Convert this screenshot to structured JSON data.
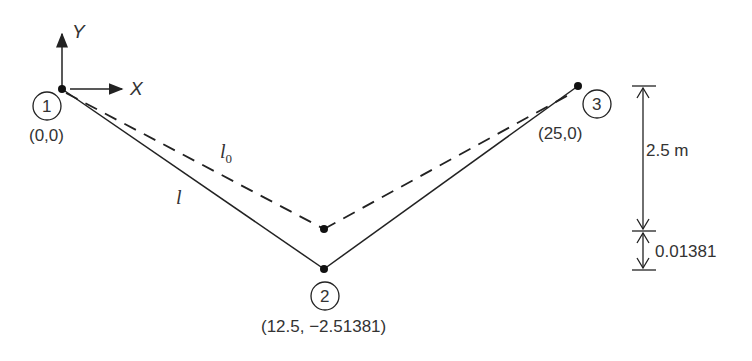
{
  "diagram": {
    "axes": {
      "y_label": "Y",
      "x_label": "X"
    },
    "nodes": [
      {
        "id": "1",
        "coord": "(0,0)"
      },
      {
        "id": "2",
        "coord": "(12.5, −2.51381)"
      },
      {
        "id": "3",
        "coord": "(25,0)"
      }
    ],
    "members": {
      "deformed_label": "l",
      "original_label": "l",
      "original_subscript": "0"
    },
    "dimensions": {
      "sag": "2.5 m",
      "extra": "0.01381"
    }
  }
}
